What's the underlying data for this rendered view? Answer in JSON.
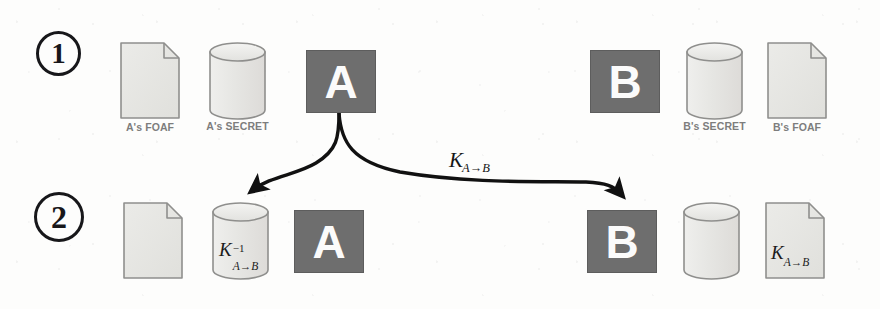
{
  "figure": {
    "background_color": "#fdfdfc",
    "entity_fill_color": "#6e6e6e",
    "icon_fill_color": "#e8e8e6",
    "icon_stroke_color": "#8a8a88",
    "label_color": "#7d7d7d",
    "ink_color": "#17171a"
  },
  "steps": [
    {
      "id": "step-1",
      "number": "1"
    },
    {
      "id": "step-2",
      "number": "2"
    }
  ],
  "row1": {
    "a_foaf": {
      "icon": "document-icon",
      "label": "A's FOAF"
    },
    "a_secret": {
      "icon": "database-cylinder-icon",
      "label": "A's SECRET"
    },
    "a_entity": {
      "icon": "entity-box",
      "letter": "A"
    },
    "b_entity": {
      "icon": "entity-box",
      "letter": "B"
    },
    "b_secret": {
      "icon": "database-cylinder-icon",
      "label": "B's SECRET"
    },
    "b_foaf": {
      "icon": "document-icon",
      "label": "B's FOAF"
    }
  },
  "row2": {
    "a_foaf": {
      "icon": "document-icon",
      "label": ""
    },
    "a_secret": {
      "icon": "database-cylinder-icon",
      "key_base": "K",
      "key_superscript": "−1",
      "key_subscript": "A→B"
    },
    "a_entity": {
      "icon": "entity-box",
      "letter": "A"
    },
    "b_entity": {
      "icon": "entity-box",
      "letter": "B"
    },
    "b_secret": {
      "icon": "database-cylinder-icon",
      "label": ""
    },
    "b_foaf": {
      "icon": "document-icon",
      "key_base": "K",
      "key_subscript": "A→B"
    }
  },
  "arrows": {
    "to_secret": {
      "name": "arrow-a-to-own-secret",
      "from": "a-entity-box-row1",
      "to": "a-secret-cylinder-row2"
    },
    "to_b": {
      "name": "arrow-a-to-b",
      "from": "a-entity-box-row1",
      "to": "b-entity-box-row2",
      "label_base": "K",
      "label_subscript": "A→B"
    }
  }
}
